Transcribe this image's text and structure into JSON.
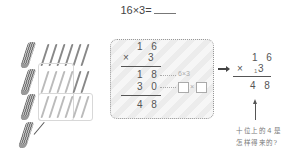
{
  "problem": {
    "expression": "16×3=",
    "answer_blank": ""
  },
  "sticks_illustration": {
    "rows": [
      {
        "bundles": 1,
        "single_sticks": 6
      },
      {
        "bundles": 1,
        "single_sticks": 6,
        "grouped": 4
      },
      {
        "bundles": 1,
        "single_sticks": 6,
        "grouped": 6
      },
      {
        "bundles": 1,
        "single_sticks": 0,
        "arrow_to_bundle": true
      }
    ]
  },
  "detailed_calc": {
    "multiplicand": "1 6",
    "multiplier_sign": "×",
    "multiplier": "3",
    "partial1": "1 8",
    "partial1_note": "6×3",
    "partial2": "3 0",
    "partial2_note_times": "×",
    "result": "4 8"
  },
  "compact_calc": {
    "multiplicand": "1 6",
    "multiplier_sign": "×",
    "carry": "1",
    "multiplier": "3",
    "result": "4 8"
  },
  "question": {
    "line1": "十位上的４是",
    "line2": "怎样得来的?"
  }
}
